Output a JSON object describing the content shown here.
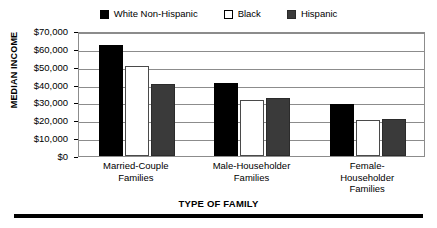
{
  "chart_data": {
    "type": "bar",
    "title": "",
    "xlabel": "TYPE OF FAMILY",
    "ylabel": "MEDIAN INCOME",
    "categories": [
      "Married-Couple Families",
      "Male-Householder Families",
      "Female-Householder Families"
    ],
    "category_lines": [
      [
        "Married-Couple",
        "Families"
      ],
      [
        "Male-Householder",
        "Families"
      ],
      [
        "Female-",
        "Householder",
        "Families"
      ]
    ],
    "series": [
      {
        "name": "White Non-Hispanic",
        "color": "#000000",
        "values": [
          62000,
          41000,
          29000
        ]
      },
      {
        "name": "Black",
        "color": "#ffffff",
        "values": [
          50500,
          31500,
          20200
        ]
      },
      {
        "name": "Hispanic",
        "color": "#3a3a3a",
        "values": [
          40500,
          32300,
          20500
        ]
      }
    ],
    "ylim": [
      0,
      70000
    ],
    "ytick_values": [
      0,
      10000,
      20000,
      30000,
      40000,
      50000,
      60000,
      70000
    ],
    "ytick_labels": [
      "$0",
      "$10,000",
      "$20,000",
      "$30,000",
      "$40,000",
      "$50,000",
      "$60,000",
      "$70,000"
    ],
    "grid": true,
    "legend_position": "top-center"
  },
  "legend": {
    "items": [
      {
        "label": "White Non-Hispanic",
        "swatch": "black-square"
      },
      {
        "label": "Black",
        "swatch": "white-square"
      },
      {
        "label": "Hispanic",
        "swatch": "gray-square"
      }
    ]
  },
  "axes": {
    "y_title": "MEDIAN INCOME",
    "x_title": "TYPE OF FAMILY"
  }
}
